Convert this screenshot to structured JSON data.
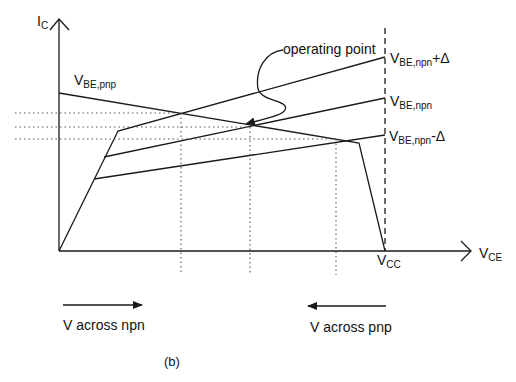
{
  "figure": {
    "caption": "(b)",
    "axes": {
      "y_label_main": "I",
      "y_label_sub": "C",
      "x_label_main": "V",
      "x_label_sub": "CE",
      "vcc_main": "V",
      "vcc_sub": "CC"
    },
    "curves": {
      "pnp_main": "V",
      "pnp_sub": "BE,pnp",
      "npn_plus_main": "V",
      "npn_plus_sub": "BE,npn",
      "npn_plus_suffix": "+Δ",
      "npn_main": "V",
      "npn_sub": "BE,npn",
      "npn_minus_main": "V",
      "npn_minus_sub": "BE,npn",
      "npn_minus_suffix": "-Δ"
    },
    "annotation": "operating point",
    "arrows": {
      "npn_direction": "V across npn",
      "pnp_direction": "V across pnp"
    },
    "colors": {
      "line": "#1a1a1a",
      "background": "#ffffff"
    }
  }
}
